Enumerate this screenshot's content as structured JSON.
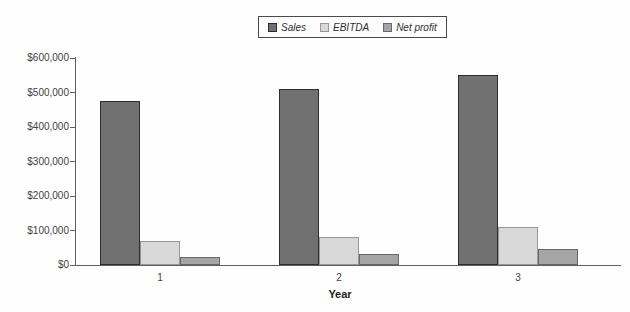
{
  "figure": {
    "background": "#fefefe",
    "axis_color": "#606060",
    "text_color": "#3f3f3f"
  },
  "chart_data": {
    "type": "bar",
    "title": "",
    "xlabel": "Year",
    "ylabel": "",
    "categories": [
      "1",
      "2",
      "3"
    ],
    "series": [
      {
        "name": "Sales",
        "values": [
          475000,
          510000,
          550000
        ],
        "color": "#717171",
        "border": "#2e2e2e"
      },
      {
        "name": "EBITDA",
        "values": [
          70000,
          80000,
          110000
        ],
        "color": "#d8d8d8",
        "border": "#979797"
      },
      {
        "name": "Net profit",
        "values": [
          22000,
          33000,
          45000
        ],
        "color": "#a5a5a5",
        "border": "#686868"
      }
    ],
    "ylim": [
      0,
      600000
    ],
    "y_tick_step": 100000,
    "y_tick_labels": [
      "$0",
      "$100,000",
      "$200,000",
      "$300,000",
      "$400,000",
      "$500,000",
      "$600,000"
    ],
    "grid": false,
    "legend_position": "top-center"
  }
}
